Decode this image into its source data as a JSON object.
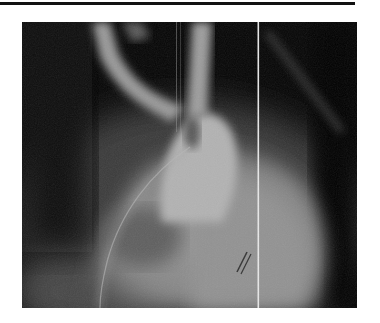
{
  "document": {
    "figure": {
      "kind": "angiogram",
      "description": "Grayscale radiographic angiogram of the aortic arch and heart with catheter",
      "colors": {
        "background": "#050505",
        "vessel": "#b4b4b4",
        "heart": "#8a8a8a",
        "rule": "#111111"
      }
    }
  }
}
